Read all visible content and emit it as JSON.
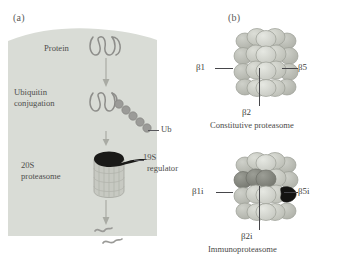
{
  "figure": {
    "background": "#ffffff"
  },
  "panel_a": {
    "letter": "(a)",
    "cell_fill": "#d9dcd6",
    "steps": [
      {
        "name": "protein",
        "label": "Protein"
      },
      {
        "name": "ubiquitin-conjugation",
        "label": "Ubiquitin\nconjugation"
      },
      {
        "name": "proteasome",
        "label": "20S\nproteasome"
      }
    ],
    "label_protein": "Protein",
    "label_ubiquitin_line1": "Ubiquitin",
    "label_ubiquitin_line2": "conjugation",
    "label_20s_line1": "20S",
    "label_20s_line2": "proteasome",
    "label_ub": "Ub",
    "label_19s_line1": "19S",
    "label_19s_line2": "regulator",
    "ubiquitin_chain_count": 5,
    "peptide_fragments": 2,
    "arrow_count": 3,
    "colors": {
      "protein_outline": "#8d8d8a",
      "ubiquitin_bead": "#9b9b98",
      "barrel_body": "#c7c9c2",
      "regulator_cap": "#1a1a18",
      "arrow": "#a9aba4"
    }
  },
  "panel_b": {
    "letter": "(b)",
    "constitutive": {
      "caption": "Constitutive proteasome",
      "subunits": [
        {
          "id": "beta1",
          "label": "β1",
          "side": "left",
          "color": "#d0d2cb"
        },
        {
          "id": "beta5",
          "label": "β5",
          "side": "right",
          "color": "#d0d2cb"
        },
        {
          "id": "beta2",
          "label": "β2",
          "side": "bottom",
          "color": "#d0d2cb"
        }
      ]
    },
    "immuno": {
      "caption": "Immunoproteasome",
      "subunits": [
        {
          "id": "beta1i",
          "label": "β1i",
          "side": "left",
          "color": "#8c8e88"
        },
        {
          "id": "beta5i",
          "label": "β5i",
          "side": "right",
          "color": "#141412"
        },
        {
          "id": "beta2i",
          "label": "β2i",
          "side": "bottom",
          "color": "#7e807a"
        }
      ]
    },
    "colors": {
      "subunit_light": "#d4d6cf",
      "subunit_mid": "#c2c4bc",
      "subunit_dark": "#b4b6ae",
      "outline": "#9b9d95",
      "highlight_gray": "#85877f",
      "highlight_black": "#141412"
    }
  }
}
